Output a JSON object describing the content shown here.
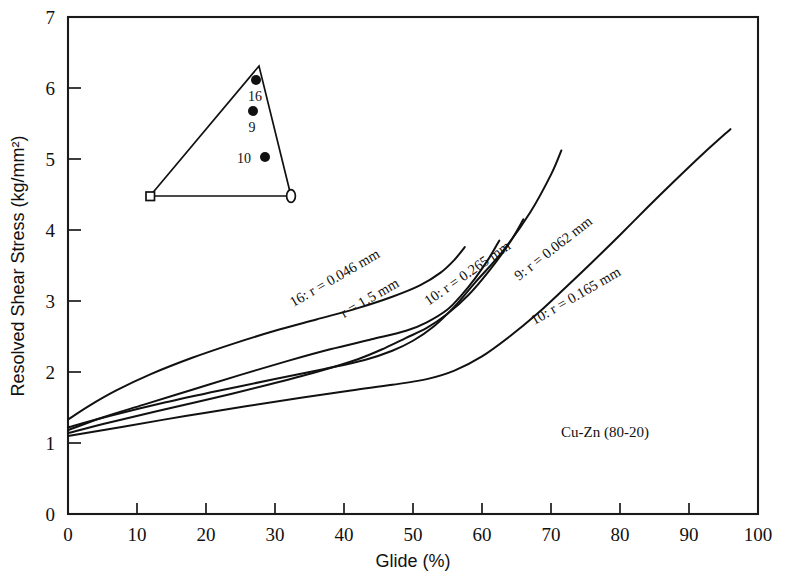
{
  "chart_data": {
    "type": "line",
    "title": "",
    "xlabel": "Glide (%)",
    "ylabel": "Resolved Shear Stress (kg/mm²)",
    "xlim": [
      0,
      100
    ],
    "ylim": [
      0,
      7
    ],
    "xticks": [
      "0",
      "10",
      "20",
      "30",
      "40",
      "50",
      "60",
      "70",
      "80",
      "90",
      "100"
    ],
    "yticks": [
      "0",
      "1",
      "2",
      "3",
      "4",
      "5",
      "6",
      "7"
    ],
    "xtick_step": 10,
    "ytick_step": 1,
    "grid": false,
    "legend_position": "inline-curve-labels",
    "annotations": [
      {
        "name": "material",
        "text": "Cu-Zn (80-20)",
        "x": 62,
        "y": 1.25
      }
    ],
    "series": [
      {
        "name": "16: r = 0.046 mm",
        "label": "16: r = 0.046 mm",
        "specimen": "16",
        "radius_mm": 0.046,
        "points": [
          [
            0,
            1.33
          ],
          [
            3,
            1.52
          ],
          [
            7,
            1.74
          ],
          [
            12,
            1.97
          ],
          [
            18,
            2.2
          ],
          [
            24,
            2.4
          ],
          [
            30,
            2.58
          ],
          [
            36,
            2.74
          ],
          [
            42,
            2.9
          ],
          [
            47,
            3.06
          ],
          [
            51,
            3.22
          ],
          [
            54,
            3.4
          ],
          [
            56,
            3.58
          ],
          [
            57.5,
            3.76
          ]
        ]
      },
      {
        "name": "r = 1.5 mm",
        "label": "r = 1.5 mm",
        "specimen": "",
        "radius_mm": 1.5,
        "points": [
          [
            0,
            1.18
          ],
          [
            5,
            1.36
          ],
          [
            11,
            1.54
          ],
          [
            18,
            1.75
          ],
          [
            25,
            1.96
          ],
          [
            32,
            2.16
          ],
          [
            38,
            2.32
          ],
          [
            44,
            2.46
          ],
          [
            49,
            2.58
          ],
          [
            52,
            2.7
          ],
          [
            55,
            2.88
          ],
          [
            57,
            3.08
          ],
          [
            59,
            3.32
          ],
          [
            61,
            3.6
          ],
          [
            62.5,
            3.85
          ]
        ]
      },
      {
        "name": "10: r = 0.265 mm",
        "label": "10: r = 0.265 mm",
        "specimen": "10",
        "radius_mm": 0.265,
        "points": [
          [
            0,
            1.14
          ],
          [
            6,
            1.29
          ],
          [
            13,
            1.45
          ],
          [
            21,
            1.63
          ],
          [
            29,
            1.82
          ],
          [
            36,
            2.0
          ],
          [
            42,
            2.18
          ],
          [
            46,
            2.34
          ],
          [
            49,
            2.48
          ],
          [
            52,
            2.62
          ],
          [
            55,
            2.82
          ],
          [
            58,
            3.08
          ],
          [
            61,
            3.42
          ],
          [
            64,
            3.82
          ],
          [
            66,
            4.15
          ]
        ]
      },
      {
        "name": "9: r = 0.062 mm",
        "label": "9: r = 0.062 mm",
        "specimen": "9",
        "radius_mm": 0.062,
        "points": [
          [
            0,
            1.22
          ],
          [
            6,
            1.38
          ],
          [
            14,
            1.57
          ],
          [
            22,
            1.74
          ],
          [
            30,
            1.9
          ],
          [
            37,
            2.04
          ],
          [
            43,
            2.17
          ],
          [
            47,
            2.3
          ],
          [
            50,
            2.44
          ],
          [
            53,
            2.64
          ],
          [
            56,
            2.92
          ],
          [
            59,
            3.26
          ],
          [
            63,
            3.7
          ],
          [
            67,
            4.25
          ],
          [
            70,
            4.78
          ],
          [
            71.5,
            5.12
          ]
        ]
      },
      {
        "name": "10: r = 0.165 mm",
        "label": "10: r = 0.165 mm",
        "specimen": "10",
        "radius_mm": 0.165,
        "points": [
          [
            0,
            1.1
          ],
          [
            8,
            1.23
          ],
          [
            17,
            1.38
          ],
          [
            26,
            1.52
          ],
          [
            34,
            1.64
          ],
          [
            41,
            1.74
          ],
          [
            47,
            1.82
          ],
          [
            52,
            1.9
          ],
          [
            56,
            2.02
          ],
          [
            60,
            2.22
          ],
          [
            64,
            2.5
          ],
          [
            68,
            2.82
          ],
          [
            72,
            3.18
          ],
          [
            76,
            3.55
          ],
          [
            80,
            3.93
          ],
          [
            84,
            4.32
          ],
          [
            88,
            4.7
          ],
          [
            92,
            5.07
          ],
          [
            96,
            5.42
          ]
        ]
      }
    ]
  },
  "inset": {
    "name": "stereographic-triangle",
    "corners": {
      "left": {
        "marker": "open-square"
      },
      "apex": {
        "marker": "none"
      },
      "right": {
        "marker": "open-ellipse"
      }
    },
    "points": [
      {
        "label": "16",
        "label_side": "below"
      },
      {
        "label": "9",
        "label_side": "below"
      },
      {
        "label": "10",
        "label_side": "left"
      }
    ]
  },
  "curve_labels": [
    {
      "id": "lbl-16-0046",
      "text": "16: r = 0.046 mm"
    },
    {
      "id": "lbl-15",
      "text": "r = 1.5 mm"
    },
    {
      "id": "lbl-10-0265",
      "text": "10: r = 0.265 mm"
    },
    {
      "id": "lbl-9-0062",
      "text": "9: r = 0.062 mm"
    },
    {
      "id": "lbl-10-0165",
      "text": "10: r = 0.165 mm"
    }
  ],
  "axes": {
    "x_title": "Glide (%)",
    "y_title": "Resolved Shear Stress (kg/mm²)"
  }
}
